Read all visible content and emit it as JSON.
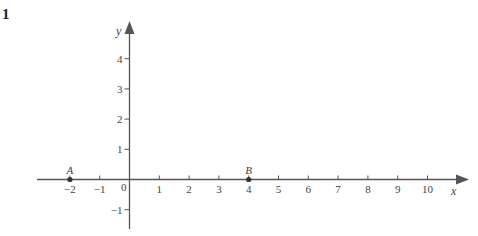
{
  "question_number": "1",
  "chart_data": {
    "type": "scatter",
    "title": "",
    "xlabel": "x",
    "ylabel": "y",
    "xlim": [
      -3,
      11
    ],
    "ylim": [
      -1.7,
      5
    ],
    "x_ticks": [
      -2,
      -1,
      1,
      2,
      3,
      4,
      5,
      6,
      7,
      8,
      9,
      10
    ],
    "y_ticks": [
      -1,
      1,
      2,
      3,
      4
    ],
    "origin_label": "0",
    "grid": false,
    "points": [
      {
        "label": "A",
        "x": -2,
        "y": 0
      },
      {
        "label": "B",
        "x": 4,
        "y": 0
      }
    ]
  },
  "colors": {
    "axis": "#555555",
    "point": "#333333",
    "text": "#444444"
  }
}
